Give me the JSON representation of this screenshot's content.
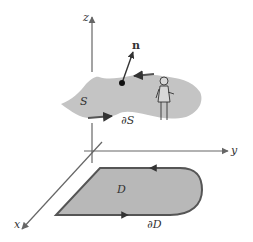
{
  "diagram": {
    "axes": {
      "z_label": "z",
      "y_label": "y",
      "x_label": "x"
    },
    "surface": {
      "label": "S",
      "boundary_label": "∂S",
      "normal_label": "n"
    },
    "region": {
      "label": "D",
      "boundary_label": "∂D"
    },
    "colors": {
      "fill": "#c4c4c4",
      "region_fill": "#b8b8b8",
      "stroke": "#555555",
      "axis": "#666666"
    }
  }
}
